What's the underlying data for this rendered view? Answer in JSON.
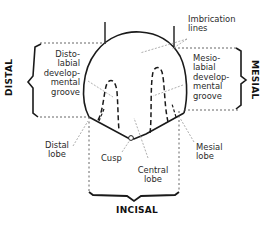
{
  "diagram": {
    "sides": {
      "distal": "DISTAL",
      "mesial": "MESIAL",
      "incisal": "INCISAL"
    },
    "labels": {
      "imbrication_lines": [
        "Imbrication",
        "lines"
      ],
      "distolabial_groove": [
        "Disto-",
        "labial",
        "develop-",
        "mental",
        "groove"
      ],
      "mesiolabial_groove": [
        "Mesio-",
        "labial",
        "develop-",
        "mental",
        "groove"
      ],
      "distal_lobe": [
        "Distal",
        "lobe"
      ],
      "cusp": [
        "Cusp"
      ],
      "central_lobe": [
        "Central",
        "lobe"
      ],
      "mesial_lobe": [
        "Mesial",
        "lobe"
      ]
    },
    "colors": {
      "ink": "#1a1a1a",
      "leader": "#9a9a9a",
      "background": "#ffffff"
    }
  }
}
